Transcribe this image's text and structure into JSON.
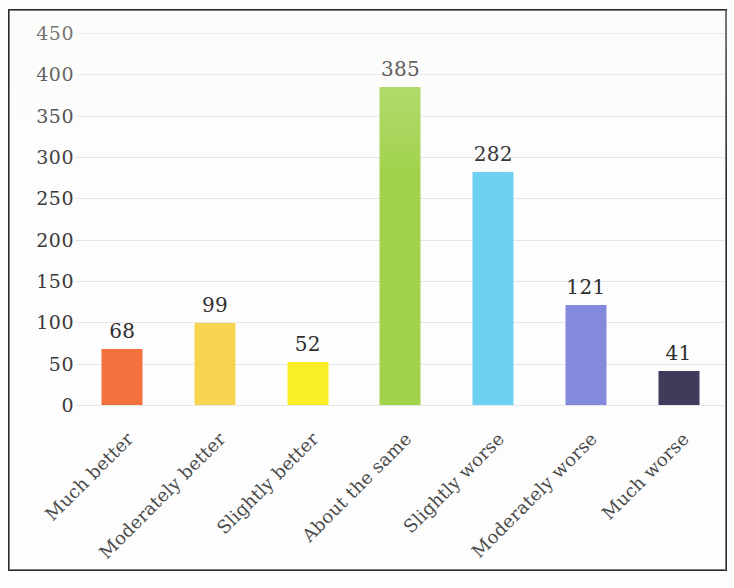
{
  "chart_data": {
    "type": "bar",
    "title": "",
    "xlabel": "",
    "ylabel": "",
    "ylim": [
      0,
      450
    ],
    "ytick_step": 50,
    "yticks": [
      "450",
      "400",
      "350",
      "300",
      "250",
      "200",
      "150",
      "100",
      "50",
      "0"
    ],
    "grid": true,
    "legend": "none",
    "categories": [
      "Much better",
      "Moderately better",
      "Slightly better",
      "About the same",
      "Slightly worse",
      "Moderately worse",
      "Much worse"
    ],
    "values": [
      68,
      99,
      52,
      385,
      282,
      121,
      41
    ],
    "value_labels": [
      "68",
      "99",
      "52",
      "385",
      "282",
      "121",
      "41"
    ],
    "colors": [
      "#F2713C",
      "#F7D44F",
      "#F9EE28",
      "#A0D24B",
      "#6ED0F2",
      "#8389DB",
      "#3E3B5B"
    ]
  },
  "figure": {
    "border_color": "#2b2b2b",
    "background": "#fdfdfd",
    "gridline_color": "#e2e2e2",
    "axis_text_color": "#3a3a3a",
    "label_text_color": "#4a4a4a",
    "x_label_rotation_deg": 45
  }
}
